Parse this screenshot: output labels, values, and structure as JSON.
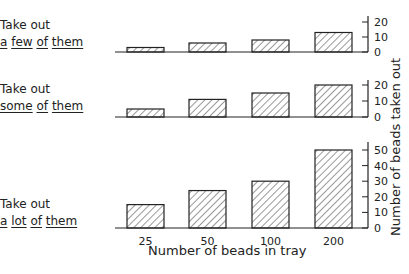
{
  "chart_data": [
    {
      "type": "bar",
      "title": "Take out a few of them",
      "categories": [
        "25",
        "50",
        "100",
        "200"
      ],
      "values": [
        3,
        6,
        8,
        13
      ],
      "ylim": [
        0,
        20
      ],
      "yticks": [
        0,
        10,
        20
      ],
      "xlabel": "Number of beads in tray",
      "ylabel": "Number of beads taken out",
      "grid": false
    },
    {
      "type": "bar",
      "title": "Take out some of them",
      "categories": [
        "25",
        "50",
        "100",
        "200"
      ],
      "values": [
        5,
        11,
        15,
        20
      ],
      "ylim": [
        0,
        20
      ],
      "yticks": [
        0,
        10,
        20
      ],
      "xlabel": "Number of beads in tray",
      "ylabel": "Number of beads taken out",
      "grid": false
    },
    {
      "type": "bar",
      "title": "Take out a lot of them",
      "categories": [
        "25",
        "50",
        "100",
        "200"
      ],
      "values": [
        15,
        24,
        30,
        50
      ],
      "ylim": [
        0,
        55
      ],
      "yticks": [
        0,
        10,
        20,
        30,
        40,
        50
      ],
      "xlabel": "Number of beads in tray",
      "ylabel": "Number of beads taken out",
      "grid": false
    }
  ],
  "panels": [
    {
      "line1": "Take out",
      "words": [
        "a",
        "few",
        "of",
        "them"
      ]
    },
    {
      "line1": "Take out",
      "words": [
        "some",
        "of",
        "them"
      ]
    },
    {
      "line1": "Take out",
      "words": [
        "a",
        "lot",
        "of",
        "them"
      ]
    }
  ],
  "axes": {
    "xlabel": "Number of beads in tray",
    "ylabel": "Number of beads taken out",
    "categories": [
      "25",
      "50",
      "100",
      "200"
    ]
  }
}
